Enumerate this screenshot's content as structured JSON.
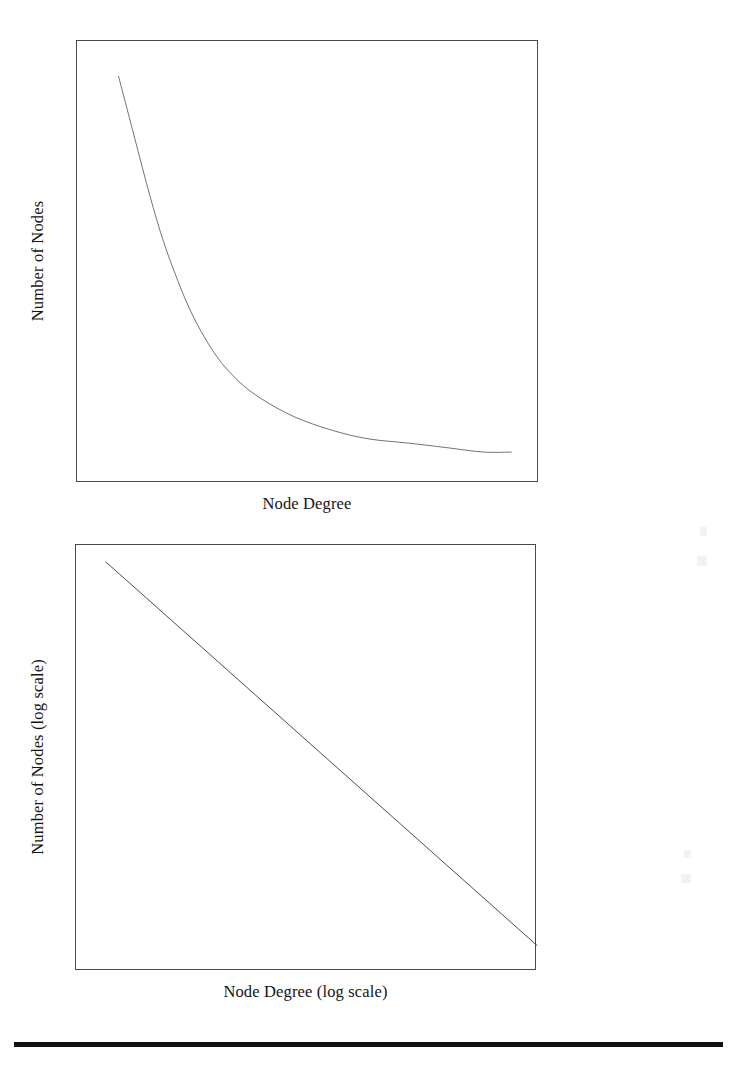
{
  "figure": {
    "background_color": "#ffffff",
    "ink_color": "#1a1a1a",
    "frame_color": "#4a4a4a",
    "rule_color": "#111111"
  },
  "panels": [
    {
      "id": "linear",
      "xlabel": "Node Degree",
      "ylabel": "Number of Nodes"
    },
    {
      "id": "log",
      "xlabel": "Node Degree (log scale)",
      "ylabel": "Number of Nodes (log scale)"
    }
  ],
  "chart_data": [
    {
      "type": "line",
      "title": "",
      "xlabel": "Node Degree",
      "ylabel": "Number of Nodes",
      "xlim": [
        0,
        100
      ],
      "ylim": [
        0,
        100
      ],
      "grid": false,
      "legend": "none",
      "axis_ticks": "none",
      "axis_scale": {
        "x": "linear",
        "y": "linear"
      },
      "annotation": "Heavy-tailed power-law degree distribution on linear axes",
      "series": [
        {
          "name": "degree distribution",
          "x": [
            9,
            12,
            15,
            18,
            21,
            25,
            30,
            35,
            40,
            47,
            55,
            63,
            72,
            80,
            88,
            94
          ],
          "y": [
            92,
            80,
            68,
            57,
            48,
            38,
            29,
            23,
            19,
            15,
            12,
            10,
            9,
            8,
            7,
            7
          ]
        }
      ]
    },
    {
      "type": "line",
      "title": "",
      "xlabel": "Node Degree (log scale)",
      "ylabel": "Number of Nodes (log scale)",
      "xlim": [
        0,
        100
      ],
      "ylim": [
        0,
        100
      ],
      "grid": false,
      "legend": "none",
      "axis_ticks": "none",
      "axis_scale": {
        "x": "log",
        "y": "log"
      },
      "annotation": "Same distribution on log-log axes forms a straight descending line",
      "series": [
        {
          "name": "degree distribution (log-log)",
          "x": [
            6.5,
            100
          ],
          "y": [
            96,
            6
          ]
        }
      ]
    }
  ]
}
